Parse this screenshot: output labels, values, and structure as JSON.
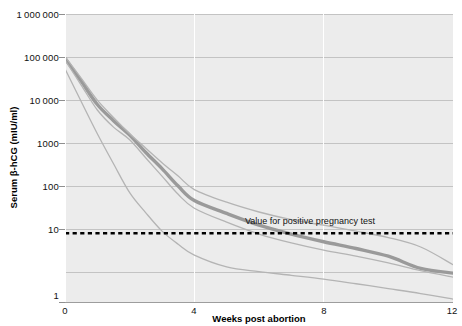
{
  "chart_data": {
    "type": "line",
    "title": "",
    "xlabel": "Weeks post abortion",
    "ylabel": "Serum β-hCG (mIU/ml)",
    "xlim": [
      0,
      12
    ],
    "ylim": [
      1,
      1000000
    ],
    "yscale": "log",
    "grid": true,
    "legend_position": "none",
    "xticks": [
      "0",
      "4",
      "8",
      "12"
    ],
    "xtick_values": [
      0,
      4,
      8,
      12
    ],
    "yticks": [
      "1",
      "10",
      "100",
      "1000",
      "10 000",
      "100 000",
      "1 000 000"
    ],
    "ytick_values": [
      1,
      10,
      100,
      1000,
      10000,
      100000,
      1000000
    ],
    "x": [
      0,
      0.5,
      1,
      1.5,
      2,
      2.5,
      3,
      3.5,
      4,
      5,
      6,
      7,
      8,
      9,
      10,
      11,
      12
    ],
    "series": [
      {
        "name": "median",
        "emphasis": "thick",
        "color": "#9a9a9a",
        "values": [
          120000,
          40000,
          13000,
          6000,
          3000,
          1300,
          600,
          260,
          130,
          70,
          40,
          26,
          18,
          13,
          9,
          5,
          4
        ]
      },
      {
        "name": "upper-range",
        "emphasis": "thin",
        "color": "#b4b4b4",
        "values": [
          130000,
          46000,
          16000,
          7000,
          3200,
          1600,
          800,
          420,
          220,
          120,
          75,
          52,
          40,
          30,
          22,
          14,
          6
        ]
      },
      {
        "name": "lower-inner-range",
        "emphasis": "thin",
        "color": "#b4b4b4",
        "values": [
          110000,
          33000,
          10000,
          4400,
          2400,
          1000,
          420,
          175,
          90,
          46,
          26,
          17,
          12,
          9,
          6.5,
          4.5,
          3.3
        ]
      },
      {
        "name": "lowest-range",
        "emphasis": "thin",
        "color": "#b4b4b4",
        "values": [
          72000,
          15000,
          3200,
          760,
          190,
          72,
          30,
          16,
          9.5,
          5.4,
          4.3,
          3.6,
          3.0,
          2.4,
          1.9,
          1.5,
          1.15
        ]
      }
    ],
    "annotations": [
      {
        "name": "positive-pregnancy-threshold",
        "text": "Value for positive pregnancy test",
        "type": "horizontal-dashed-line",
        "y_value": 27,
        "color": "#000000"
      }
    ],
    "plot_background": "#ececec",
    "gridline_color": "#c8c8c8",
    "vertical_gridline_color": "#ffffff"
  }
}
